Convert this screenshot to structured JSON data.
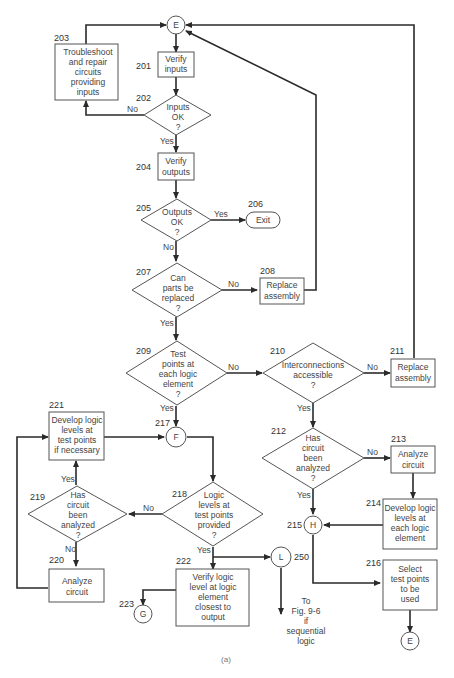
{
  "figure_label": "(a)",
  "nodes": {
    "n201": {
      "id": "201",
      "lines": [
        "Verify",
        "inputs"
      ]
    },
    "n202": {
      "id": "202",
      "lines": [
        "Inputs",
        "OK",
        "?"
      ]
    },
    "n203": {
      "id": "203",
      "lines": [
        "Troubleshoot",
        "and repair",
        "circuits",
        "providing",
        "inputs"
      ]
    },
    "n204": {
      "id": "204",
      "lines": [
        "Verify",
        "outputs"
      ]
    },
    "n205": {
      "id": "205",
      "lines": [
        "Outputs",
        "OK",
        "?"
      ]
    },
    "n206": {
      "id": "206",
      "lines": [
        "Exit"
      ]
    },
    "n207": {
      "id": "207",
      "lines": [
        "Can",
        "parts be",
        "replaced",
        "?"
      ]
    },
    "n208": {
      "id": "208",
      "lines": [
        "Replace",
        "assembly"
      ]
    },
    "n209": {
      "id": "209",
      "lines": [
        "Test",
        "points at",
        "each logic",
        "element",
        "?"
      ]
    },
    "n210": {
      "id": "210",
      "lines": [
        "Interconnections",
        "accessible",
        "?"
      ]
    },
    "n211": {
      "id": "211",
      "lines": [
        "Replace",
        "assembly"
      ]
    },
    "n212": {
      "id": "212",
      "lines": [
        "Has",
        "circuit",
        "been",
        "analyzed",
        "?"
      ]
    },
    "n213": {
      "id": "213",
      "lines": [
        "Analyze",
        "circuit"
      ]
    },
    "n214": {
      "id": "214",
      "lines": [
        "Develop logic",
        "levels at",
        "each logic",
        "element"
      ]
    },
    "n215": {
      "id": "215",
      "lines": [
        "H"
      ]
    },
    "n216": {
      "id": "216",
      "lines": [
        "Select",
        "test points",
        "to be",
        "used"
      ]
    },
    "n217": {
      "id": "217",
      "lines": [
        "F"
      ]
    },
    "n218": {
      "id": "218",
      "lines": [
        "Logic",
        "levels at",
        "test points",
        "provided",
        "?"
      ]
    },
    "n219": {
      "id": "219",
      "lines": [
        "Has",
        "circuit",
        "been",
        "analyzed",
        "?"
      ]
    },
    "n220": {
      "id": "220",
      "lines": [
        "Analyze",
        "circuit"
      ]
    },
    "n221": {
      "id": "221",
      "lines": [
        "Develop logic",
        "levels at",
        "test points",
        "if necessary"
      ]
    },
    "n222": {
      "id": "222",
      "lines": [
        "Verify logic",
        "level at logic",
        "element",
        "closest to",
        "output"
      ]
    },
    "n223": {
      "id": "223",
      "lines": [
        "G"
      ]
    },
    "n250": {
      "id": "250",
      "lines": [
        "L"
      ]
    },
    "eTop": {
      "lines": [
        "E"
      ]
    },
    "eBottom": {
      "lines": [
        "E"
      ]
    }
  },
  "edge_labels": {
    "yes": "Yes",
    "no": "No"
  },
  "note_250": [
    "To",
    "Fig. 9-6",
    "if",
    "sequential",
    "logic"
  ]
}
